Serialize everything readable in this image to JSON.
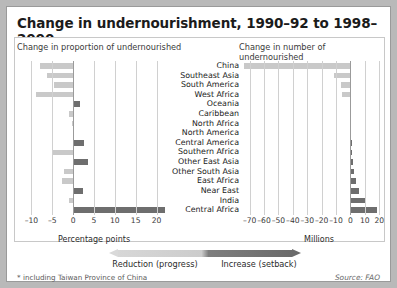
{
  "title": "Change in undernourishment, 1990–92 to 1998–2000",
  "headers": {
    "left": "Change in proportion of undernourished",
    "right": "Change in number of undernourished"
  },
  "axis_titles": {
    "left": "Percentage points",
    "right": "Millions"
  },
  "legend": {
    "left_label": "Reduction (progress)",
    "right_label": "Increase (setback)"
  },
  "footnote": "* including Taiwan Province of China",
  "source": "Source: FAO",
  "colors": {
    "negative": "#c9c9c9",
    "positive": "#6e6e6e",
    "grid": "#d0d0d0",
    "zero": "#9b9b9b"
  },
  "chart_data": [
    {
      "type": "bar",
      "orientation": "horizontal",
      "title": "Change in proportion of undernourished",
      "xlabel": "Percentage points",
      "ylabel": "",
      "xlim": [
        -12.5,
        22.5
      ],
      "ticks": [
        -10,
        -5,
        0,
        5,
        10,
        15,
        20
      ],
      "grid": true,
      "categories": [
        "China",
        "Southeast Asia",
        "South America",
        "West Africa",
        "Oceania",
        "Caribbean",
        "North Africa",
        "North America",
        "Central America",
        "Southern Africa",
        "Other East Asia",
        "Other South Asia",
        "East Africa",
        "Near East",
        "India",
        "Central Africa"
      ],
      "values": [
        -8.0,
        -6.3,
        -4.6,
        -9.0,
        1.7,
        -0.9,
        -0.2,
        0.0,
        2.5,
        -4.8,
        3.5,
        -2.2,
        -2.6,
        2.4,
        -1.1,
        22.0
      ]
    },
    {
      "type": "bar",
      "orientation": "horizontal",
      "title": "Change in number of undernourished",
      "xlabel": "Millions",
      "ylabel": "",
      "xlim": [
        -76,
        24
      ],
      "ticks": [
        -70,
        -60,
        -50,
        -40,
        -30,
        -20,
        -10,
        0,
        10,
        20
      ],
      "grid": true,
      "categories": [
        "China",
        "Southeast Asia",
        "South America",
        "West Africa",
        "Oceania",
        "Caribbean",
        "North Africa",
        "North America",
        "Central America",
        "Southern Africa",
        "Other East Asia",
        "Other South Asia",
        "East Africa",
        "Near East",
        "India",
        "Central Africa"
      ],
      "values": [
        -74.0,
        -11.4,
        -6.5,
        -6.2,
        -0.1,
        -0.5,
        -0.3,
        0.0,
        1.3,
        1.1,
        2.0,
        2.3,
        4.0,
        6.0,
        10.5,
        18.5
      ]
    }
  ]
}
